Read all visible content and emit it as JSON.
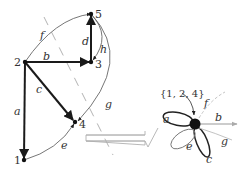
{
  "colors": {
    "edge_bold": "#1a1a1a",
    "edge_thin": "#555555",
    "edge_light": "#aaaaaa",
    "cut_dash": "#999999",
    "arrow_outline": "#aaaaaa",
    "node": "#111111",
    "background": "#ffffff"
  },
  "left_graph": {
    "nodes": [
      {
        "id": "1",
        "label": "1"
      },
      {
        "id": "2",
        "label": "2"
      },
      {
        "id": "3",
        "label": "3"
      },
      {
        "id": "4",
        "label": "4"
      },
      {
        "id": "5",
        "label": "5"
      }
    ],
    "edges": [
      {
        "id": "a",
        "label": "a",
        "from": "2",
        "to": "1",
        "style": "bold"
      },
      {
        "id": "b",
        "label": "b",
        "from": "2",
        "to": "3",
        "style": "bold"
      },
      {
        "id": "c",
        "label": "c",
        "from": "2",
        "to": "4",
        "style": "bold"
      },
      {
        "id": "d",
        "label": "d",
        "from": "3",
        "to": "5",
        "style": "bold"
      },
      {
        "id": "e",
        "label": "e",
        "from": "1",
        "to": "4",
        "style": "thin"
      },
      {
        "id": "f",
        "label": "f",
        "from": "2",
        "to": "5",
        "style": "thin"
      },
      {
        "id": "g",
        "label": "g",
        "from": "5",
        "to": "4",
        "style": "thin"
      },
      {
        "id": "h",
        "label": "h",
        "from": "5",
        "to": "3",
        "style": "thin"
      }
    ]
  },
  "transition_arrow": {
    "direction": "right",
    "style": "hollow"
  },
  "right_graph": {
    "contracted_node_label": "{1, 2, 4}",
    "loops": [
      {
        "label": "a"
      },
      {
        "label": "c"
      },
      {
        "label": "e"
      }
    ],
    "outgoing_edges": [
      {
        "label": "b"
      },
      {
        "label": "f"
      },
      {
        "label": "g"
      }
    ]
  }
}
